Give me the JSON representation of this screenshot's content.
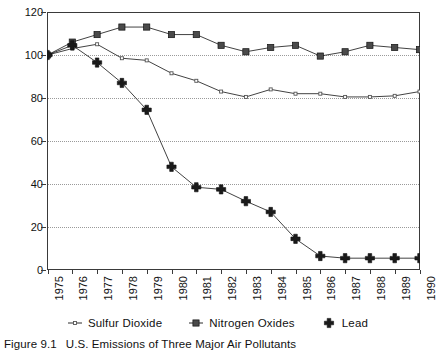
{
  "chart_data": {
    "type": "line",
    "title": "",
    "xlabel": "",
    "ylabel": "% of 1975 Emissions",
    "ylim": [
      0,
      120
    ],
    "yticks": [
      0,
      20,
      40,
      60,
      80,
      100,
      120
    ],
    "grid": "horizontal-dotted",
    "legend_position": "bottom",
    "categories": [
      "1975",
      "1976",
      "1977",
      "1978",
      "1979",
      "1980",
      "1981",
      "1982",
      "1983",
      "1984",
      "1985",
      "1986",
      "1987",
      "1988",
      "1989",
      "1990"
    ],
    "series": [
      {
        "name": "Sulfur Dioxide",
        "marker": "small-dot",
        "color": "#555555",
        "values": [
          100,
          103,
          105,
          98.5,
          97.5,
          91.5,
          88,
          83,
          80.5,
          84,
          82,
          82,
          80.5,
          80.5,
          81,
          83
        ]
      },
      {
        "name": "Nitrogen Oxides",
        "marker": "filled-square",
        "color": "#4a4a4a",
        "values": [
          100,
          106,
          109.5,
          113,
          113,
          109.5,
          109.5,
          104.5,
          101.5,
          103.5,
          104.5,
          99.5,
          101.5,
          104.5,
          103.5,
          102.5
        ]
      },
      {
        "name": "Lead",
        "marker": "plus-cross",
        "color": "#1a1a1a",
        "values": [
          100,
          104.5,
          96.5,
          87,
          74.5,
          48,
          38.5,
          37.5,
          32,
          27,
          14.5,
          6.5,
          5.5,
          5.5,
          5.5,
          5.5
        ]
      }
    ]
  },
  "caption": {
    "label": "Figure 9.1",
    "text": "U.S. Emissions of Three Major Air Pollutants"
  }
}
